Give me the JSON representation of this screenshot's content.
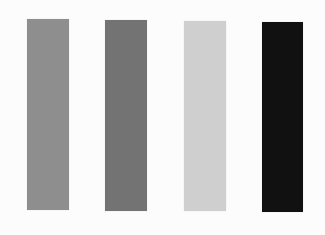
{
  "swatches": [
    {
      "id": "medium-gray",
      "color": "#8e8e8e",
      "x": 27,
      "y": 19,
      "w": 42,
      "h": 191
    },
    {
      "id": "dark-gray",
      "color": "#737373",
      "x": 105,
      "y": 20,
      "w": 42,
      "h": 191
    },
    {
      "id": "light-gray",
      "color": "#cfcfcf",
      "x": 184,
      "y": 21,
      "w": 42,
      "h": 190
    },
    {
      "id": "black",
      "color": "#111111",
      "x": 262,
      "y": 22,
      "w": 41,
      "h": 190
    }
  ]
}
